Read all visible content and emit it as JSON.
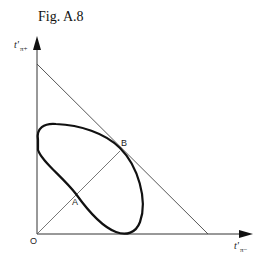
{
  "figure": {
    "title": "Fig. A.8",
    "y_axis_label": "t'",
    "y_axis_subscript": "π+",
    "x_axis_label": "t'",
    "x_axis_subscript": "π−",
    "origin_label": "O",
    "points": [
      {
        "label": "A",
        "description": "intersection of diagonal OB with the closed curve (lower branch)"
      },
      {
        "label": "B",
        "description": "tangent point of closed curve with the descending line"
      }
    ],
    "elements": [
      "vertical axis t'π+ with arrow",
      "horizontal axis t'π− with arrow",
      "descending straight line from vertical axis to horizontal axis",
      "straight line from origin O through A to B",
      "closed tilted loop curve touching both axes and the descending line"
    ],
    "colors": {
      "line": "#333333",
      "curve": "#111111",
      "background": "#ffffff"
    }
  }
}
